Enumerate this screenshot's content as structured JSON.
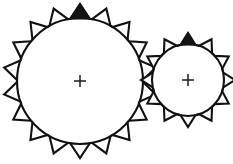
{
  "figure": {
    "background_color": "#ffffff",
    "stroke_color": "#111111",
    "timing_mark_color": "#141414",
    "width": 233,
    "height": 164
  },
  "gears": [
    {
      "id": "large-gear",
      "label": "Large gear",
      "center_x": 80,
      "center_y": 81,
      "tip_radius": 77,
      "root_radius": 63,
      "tooth_count": 18,
      "tooth_half_angle_deg": 9,
      "start_angle_deg": -90,
      "timing_tooth_index": 0,
      "center_mark": {
        "type": "crosshair",
        "arm_length": 6
      }
    },
    {
      "id": "small-gear",
      "label": "Small gear",
      "center_x": 188,
      "center_y": 80,
      "tip_radius": 47,
      "root_radius": 36,
      "tooth_count": 12,
      "tooth_half_angle_deg": 12,
      "start_angle_deg": -90,
      "timing_tooth_index": 0,
      "center_mark": {
        "type": "crosshair",
        "arm_length": 6
      }
    }
  ]
}
